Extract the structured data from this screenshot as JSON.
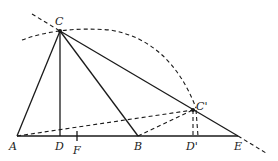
{
  "diagram": {
    "type": "geometry",
    "points": {
      "A": "A",
      "B": "B",
      "C": "C",
      "C_prime": "C'",
      "D": "D",
      "D_prime": "D'",
      "E": "E",
      "F": "F"
    },
    "segments_solid": [
      "AC",
      "CD",
      "CB",
      "CE",
      "AE"
    ],
    "segments_dashed": [
      "AC'",
      "BC'",
      "C'D'",
      "CC' arc",
      "line CE extended"
    ]
  }
}
